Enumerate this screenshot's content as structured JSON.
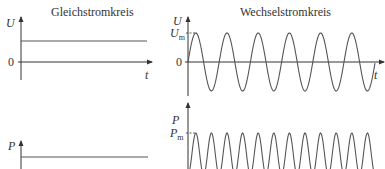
{
  "panels": {
    "dc": {
      "title": "Gleichstromkreis",
      "voltage_axis_label": "U",
      "power_axis_label": "P",
      "zero_label": "0",
      "time_axis_label": "t"
    },
    "ac": {
      "title": "Wechselstromkreis",
      "voltage_axis_label": "U",
      "voltage_peak_label_main": "U",
      "voltage_peak_label_sub": "m",
      "power_axis_label": "P",
      "power_peak_label_main": "P",
      "power_peak_label_sub": "m",
      "zero_label": "0",
      "time_axis_label": "t"
    }
  },
  "colors": {
    "line": "#555555",
    "axis": "#333333",
    "text": "#333333"
  },
  "chart_data": [
    {
      "type": "line",
      "title": "Gleichstromkreis",
      "ylabel": "U",
      "xlabel": "t",
      "description": "constant DC voltage above zero",
      "y_level": "constant"
    },
    {
      "type": "line",
      "title": "Gleichstromkreis",
      "ylabel": "P",
      "description": "constant DC power"
    },
    {
      "type": "line",
      "title": "Wechselstromkreis",
      "ylabel": "U",
      "xlabel": "t",
      "description": "sinusoidal AC voltage with amplitude U_m, about 6 periods",
      "peak_label": "U_m"
    },
    {
      "type": "line",
      "title": "Wechselstromkreis",
      "ylabel": "P",
      "description": "AC power p = U_m·I_m·sin², non-negative, peak P_m, twice the voltage frequency",
      "peak_label": "P_m"
    }
  ]
}
